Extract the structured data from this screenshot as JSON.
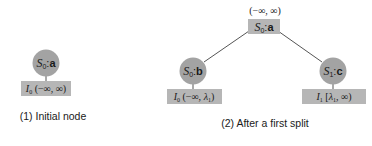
{
  "colors": {
    "circle_fill": "#a3a3a3",
    "box_fill": "#b6b6b6",
    "edge": "#555555",
    "text": "#1a1a1a"
  },
  "panel1": {
    "caption": "(1) Initial node",
    "node": {
      "state": "S",
      "state_sub": "0",
      "sep": ":",
      "label": "a"
    },
    "interval_box": {
      "var": "I",
      "var_sub": "0",
      "interval": " (−∞, ∞)"
    }
  },
  "panel2": {
    "caption": "(2) After a first split",
    "root": {
      "state": "S",
      "state_sub": "0",
      "sep": ":",
      "label": "a",
      "interval_above": "(−∞, ∞)"
    },
    "left_child": {
      "node": {
        "state": "S",
        "state_sub": "0",
        "sep": ":",
        "label": "b"
      },
      "interval_box": {
        "var": "I",
        "var_sub": "0",
        "interval_open": " (−∞, ",
        "lambda": "λ",
        "lambda_sub": "1",
        "interval_close": ")"
      }
    },
    "right_child": {
      "node": {
        "state": "S",
        "state_sub": "1",
        "sep": ":",
        "label": "c"
      },
      "interval_box": {
        "var": "I",
        "var_sub": "1",
        "interval_open": " [",
        "lambda": "λ",
        "lambda_sub": "1",
        "interval_close": ", ∞)"
      }
    }
  }
}
